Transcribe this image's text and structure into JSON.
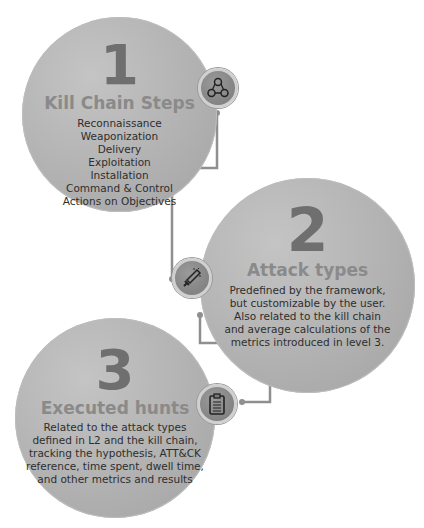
{
  "steps": [
    {
      "number": "1",
      "title": "Kill Chain Steps",
      "items": [
        "Reconnaissance",
        "Weaponization",
        "Delivery",
        "Exploitation",
        "Installation",
        "Command & Control",
        "Actions on Objectives"
      ],
      "icon": "network-nodes-icon"
    },
    {
      "number": "2",
      "title": "Attack types",
      "lines": [
        "Predefined by the framework,",
        "but customizable by the user.",
        "Also related to the kill chain",
        "and average calculations of the",
        "metrics introduced in level 3."
      ],
      "icon": "sword-icon"
    },
    {
      "number": "3",
      "title": "Executed hunts",
      "lines": [
        "Related to the attack types",
        "defined in L2 and the kill chain,",
        "tracking the hypothesis, ATT&CK",
        "reference, time spent, dwell time,",
        "and other metrics and results"
      ],
      "icon": "clipboard-icon"
    }
  ],
  "colors": {
    "circle": "#b2b2b2",
    "number": "#6f6f6f",
    "title": "#8a8a8a",
    "connector": "#8f8f8f"
  }
}
